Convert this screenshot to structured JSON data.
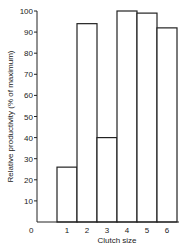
{
  "chart_data": {
    "type": "bar",
    "title": "",
    "xlabel": "Clutch size",
    "ylabel": "Relative productivity (% of maximum)",
    "categories": [
      "1",
      "2",
      "3",
      "4",
      "5",
      "6"
    ],
    "values": [
      26,
      94,
      40,
      100,
      99,
      92
    ],
    "ylim": [
      0,
      100
    ],
    "yticks": [
      10,
      20,
      30,
      40,
      50,
      60,
      70,
      80,
      90,
      100
    ],
    "origin_label": "0",
    "grid": false,
    "legend": "none"
  }
}
